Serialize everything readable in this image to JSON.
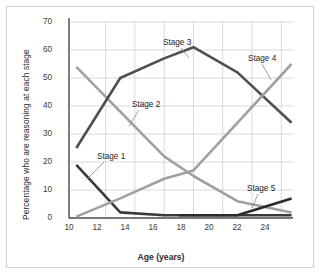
{
  "figure": {
    "frame_color": "#d2d2d2",
    "background": "#ffffff"
  },
  "axes": {
    "x_title": "Age (years)",
    "y_title": "Percentage who are reasoning at each stage",
    "x_ticks": [
      "10",
      "12",
      "14",
      "16",
      "18",
      "20",
      "22",
      "24"
    ],
    "y_ticks": [
      "0",
      "10",
      "20",
      "30",
      "40",
      "50",
      "60",
      "70"
    ],
    "grid_color": "#cfcfcf",
    "axis_color": "#4a4a4a"
  },
  "series_labels": [
    {
      "name": "stage-1-label",
      "text": "Stage 1"
    },
    {
      "name": "stage-2-label",
      "text": "Stage 2"
    },
    {
      "name": "stage-3-label",
      "text": "Stage 3"
    },
    {
      "name": "stage-4-label",
      "text": "Stage 4"
    },
    {
      "name": "stage-5-label",
      "text": "Stage 5"
    }
  ],
  "chart_data": {
    "type": "line",
    "title": "",
    "xlabel": "Age (years)",
    "ylabel": "Percentage who are reasoning at each stage",
    "xlim": [
      9.5,
      24.8
    ],
    "ylim": [
      0,
      70
    ],
    "xticks": [
      10,
      12,
      14,
      16,
      18,
      20,
      22,
      24
    ],
    "yticks": [
      0,
      10,
      20,
      30,
      40,
      50,
      60,
      70
    ],
    "grid": true,
    "legend": "inline-annotations",
    "series": [
      {
        "name": "Stage 1",
        "color": "#3a3a3a",
        "x": [
          10,
          13,
          16,
          17,
          21,
          24.7
        ],
        "values": [
          19,
          2,
          1,
          1,
          1,
          1
        ]
      },
      {
        "name": "Stage 2",
        "color": "#a0a0a0",
        "x": [
          10,
          13,
          16,
          18,
          21,
          24.7
        ],
        "values": [
          54,
          38,
          22,
          15,
          6,
          2
        ]
      },
      {
        "name": "Stage 3",
        "color": "#4f4f4f",
        "x": [
          10,
          13,
          16,
          18,
          21,
          24.7
        ],
        "values": [
          25,
          50,
          57,
          61,
          52,
          34
        ]
      },
      {
        "name": "Stage 4",
        "color": "#a0a0a0",
        "x": [
          10,
          13,
          16,
          18,
          21,
          24.7
        ],
        "values": [
          0.5,
          7,
          14,
          17,
          34,
          55
        ]
      },
      {
        "name": "Stage 5",
        "color": "#2a2a2a",
        "x": [
          17,
          21,
          24.7
        ],
        "values": [
          1,
          1,
          7
        ]
      }
    ]
  }
}
